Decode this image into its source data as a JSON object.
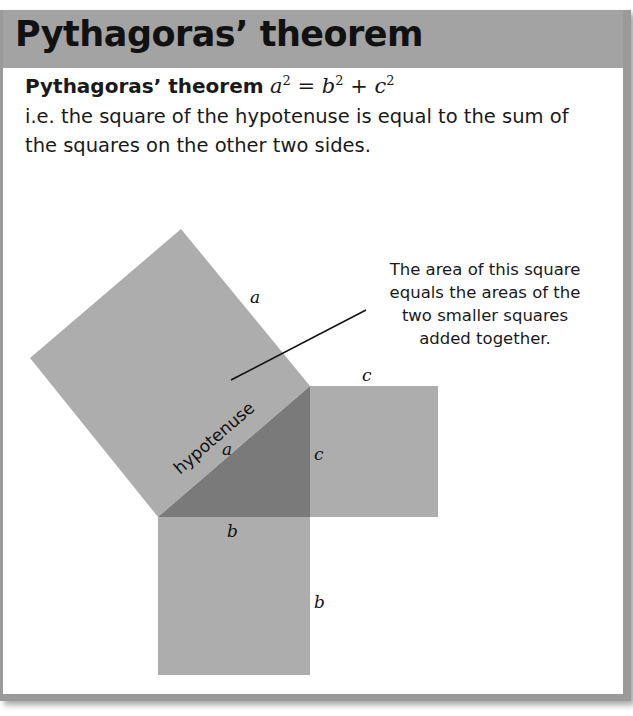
{
  "header": {
    "title": "Pythagoras’ theorem"
  },
  "statement": {
    "label": "Pythagoras’ theorem",
    "formula": {
      "lhs_base": "a",
      "rhs_base1": "b",
      "rhs_base2": "c",
      "exponent": "2",
      "equals": " = ",
      "plus": " + "
    },
    "description": "i.e. the square of the hypotenuse is equal to the sum of the squares on the other two sides."
  },
  "diagram": {
    "callout_lines": [
      "The area of this square",
      "equals the areas of the",
      "two smaller squares",
      "added together."
    ],
    "hypotenuse_label": "hypotenuse",
    "side_labels": {
      "big_square_outer": "a",
      "hypotenuse_inner": "a",
      "c_square_top": "c",
      "c_triangle_side": "c",
      "b_triangle_side": "b",
      "b_square_right": "b"
    },
    "colors": {
      "square_fill": "#adadad",
      "triangle_fill": "#7a7a7a",
      "header_fill": "#a3a3a3",
      "frame_border": "#9a9a9a"
    }
  }
}
